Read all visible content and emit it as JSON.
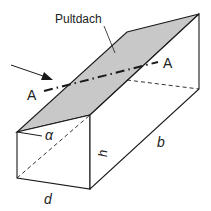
{
  "diagram": {
    "title_label": "Pultdach",
    "section_label_left": "A",
    "section_label_right": "A",
    "angle_label": "α",
    "height_label": "h",
    "length_label": "b",
    "depth_label": "d",
    "colors": {
      "roof_fill": "#c8c8c8",
      "line": "#1a1a1a",
      "background": "#ffffff"
    }
  }
}
